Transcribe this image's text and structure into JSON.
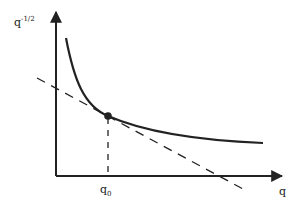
{
  "diagram": {
    "y_axis_label": "q",
    "y_axis_exponent": "-1/2",
    "x_axis_label": "q",
    "x_tick_label": "q",
    "x_tick_subscript": "0",
    "elements": [
      {
        "type": "curve",
        "description": "decreasing convex curve q^(-1/2)",
        "style": "solid"
      },
      {
        "type": "tangent-line",
        "description": "tangent at q0",
        "style": "dashed"
      },
      {
        "type": "point",
        "description": "tangency point at q0",
        "style": "filled"
      },
      {
        "type": "vertical-guide",
        "description": "from tangency point down to x-axis at q0",
        "style": "dashed"
      }
    ],
    "colors": {
      "ink": "#222222",
      "background": "#ffffff"
    }
  }
}
